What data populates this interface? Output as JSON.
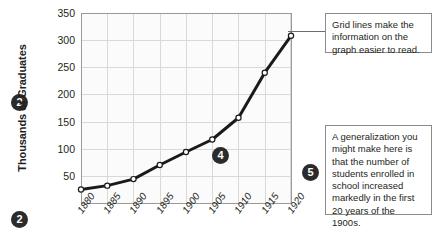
{
  "chart_data": {
    "type": "line",
    "title": "",
    "xlabel": "",
    "ylabel": "Thousands of Graduates",
    "x": [
      1880,
      1885,
      1890,
      1895,
      1900,
      1905,
      1910,
      1915,
      1920
    ],
    "categories": [
      "1880",
      "1885",
      "1890",
      "1895",
      "1900",
      "1905",
      "1910",
      "1915",
      "1920"
    ],
    "values": [
      25,
      32,
      44,
      70,
      94,
      117,
      157,
      240,
      308
    ],
    "series": [
      {
        "name": "Graduates",
        "values": [
          25,
          32,
          44,
          70,
          94,
          117,
          157,
          240,
          308
        ]
      }
    ],
    "ylim": [
      0,
      350
    ],
    "yticks": [
      50,
      100,
      150,
      200,
      250,
      300,
      350
    ],
    "ytick_labels": [
      "50",
      "100",
      "150",
      "200",
      "250",
      "300",
      "350"
    ],
    "xlim": [
      1880,
      1920
    ],
    "grid": true,
    "legend": false,
    "marker": "open-circle",
    "line_color": "#1a1a1a"
  },
  "annotations": {
    "badge_y_axis": "2",
    "badge_x_axis": "2",
    "badge_plot": "4",
    "badge_callout": "5",
    "callout_grid": "Grid lines make the information on the graph easier to read.",
    "callout_generalization": "A generalization you might make here is that the number of students enrolled in school increased markedly in the first 20 years of the 1900s."
  }
}
